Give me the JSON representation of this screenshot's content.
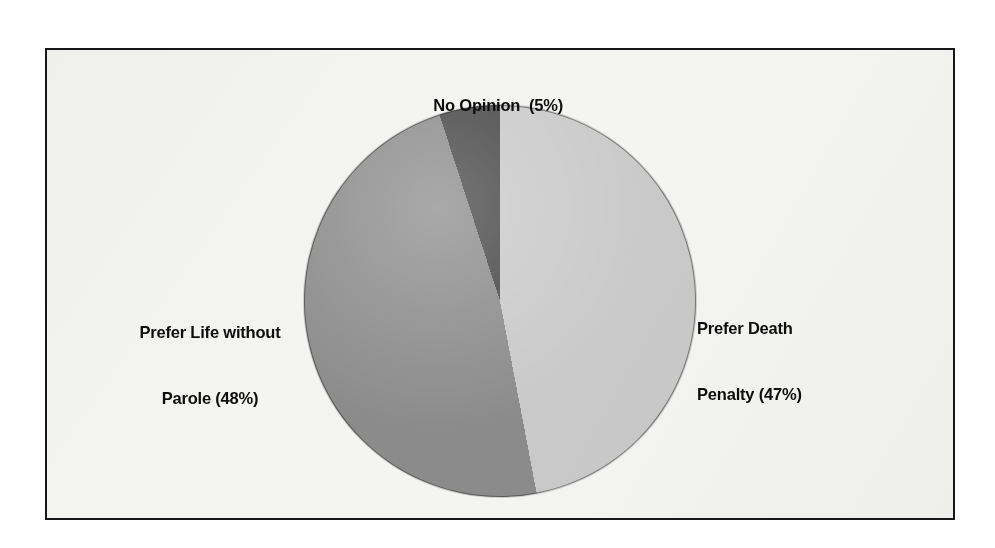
{
  "figure": {
    "background_color": "#f4f4f2",
    "border_color": "#17171a",
    "page_color": "#ffffff"
  },
  "chart_data": {
    "type": "pie",
    "title": "",
    "subtitle": "",
    "xlabel": "",
    "ylabel": "",
    "legend_position": "none",
    "grid": false,
    "units": "percent",
    "total": 100,
    "start_angle_deg": 0,
    "direction": "clockwise",
    "categories": [
      "Prefer Death Penalty",
      "Prefer Life without Parole",
      "No Opinion"
    ],
    "values": [
      47,
      48,
      5
    ],
    "colors": [
      "#c9c9c9",
      "#8b8b8b",
      "#474747"
    ],
    "slices": [
      {
        "name": "Prefer Death Penalty",
        "value": 47,
        "color": "#c9c9c9",
        "start_angle_deg": 0.0,
        "end_angle_deg": 169.2,
        "label_line_1": "Prefer Death",
        "label_line_2": "Penalty (47%)"
      },
      {
        "name": "Prefer Life without Parole",
        "value": 48,
        "color": "#8b8b8b",
        "start_angle_deg": 169.2,
        "end_angle_deg": 342.0,
        "label_line_1": "Prefer Life without",
        "label_line_2": "Parole (48%)"
      },
      {
        "name": "No Opinion",
        "value": 5,
        "color": "#474747",
        "start_angle_deg": 342.0,
        "end_angle_deg": 360.0,
        "label_line_1": "No Opinion  (5%)",
        "label_line_2": ""
      }
    ]
  },
  "labels": {
    "no_opinion": "No Opinion  (5%)",
    "death_penalty_line_1": "Prefer Death",
    "death_penalty_line_2": "Penalty (47%)",
    "life_parole_line_1": "Prefer Life without",
    "life_parole_line_2": "Parole (48%)"
  }
}
